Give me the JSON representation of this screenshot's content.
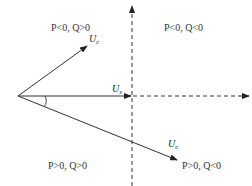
{
  "diagram": {
    "type": "phasor-diagram",
    "colors": {
      "line": "#333333",
      "text": "#222222",
      "background": "#ffffff"
    },
    "origin": {
      "x": 18,
      "y": 96
    },
    "axes": {
      "vertical": {
        "x": 132,
        "y_top": 4,
        "y_bottom": 186,
        "style": "dashed",
        "arrow": "up"
      },
      "horizontal_dashed": {
        "y": 96,
        "x_start": 132,
        "x_end": 250,
        "style": "dashed",
        "arrow": "right"
      }
    },
    "vectors": [
      {
        "id": "uc-upper",
        "label_main": "U",
        "label_sub": "c",
        "from": [
          18,
          96
        ],
        "to": [
          87,
          46
        ]
      },
      {
        "id": "us-reference",
        "label_main": "U",
        "label_sub": "s",
        "from": [
          18,
          96
        ],
        "to": [
          131,
          96
        ]
      },
      {
        "id": "uc-lower",
        "label_main": "U",
        "label_sub": "c",
        "from": [
          18,
          96
        ],
        "to": [
          177,
          160
        ]
      }
    ],
    "angle_arc": {
      "label": "δ",
      "visible_label": false
    },
    "quadrants": [
      {
        "id": "upper-left",
        "text": "P<0,  Q>0"
      },
      {
        "id": "upper-right",
        "text": "P<0,  Q<0"
      },
      {
        "id": "lower-left",
        "text": "P>0,  Q>0"
      },
      {
        "id": "lower-right",
        "text": "P>0,  Q<0"
      }
    ]
  }
}
